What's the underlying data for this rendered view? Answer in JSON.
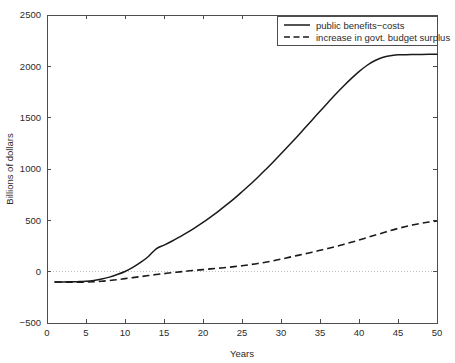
{
  "chart_data": {
    "type": "line",
    "title": "",
    "xlabel": "Years",
    "ylabel": "Billions of dollars",
    "xlim": [
      0,
      50
    ],
    "ylim": [
      -500,
      2500
    ],
    "xticks": [
      0,
      5,
      10,
      15,
      20,
      25,
      30,
      35,
      40,
      45,
      50
    ],
    "xtick_labels": [
      "0",
      "5",
      "10",
      "15",
      "20",
      "25",
      "30",
      "35",
      "40",
      "45",
      "50"
    ],
    "yticks": [
      -500,
      0,
      500,
      1000,
      1500,
      2000,
      2500
    ],
    "ytick_labels": [
      "-500",
      "0",
      "500",
      "1000",
      "1500",
      "2000",
      "2500"
    ],
    "grid": false,
    "zero_reference_line": true,
    "legend_position": "top-right",
    "x": [
      1,
      2,
      3,
      4,
      5,
      6,
      7,
      8,
      9,
      10,
      11,
      12,
      13,
      14,
      15,
      16,
      17,
      18,
      19,
      20,
      21,
      22,
      23,
      24,
      25,
      26,
      27,
      28,
      29,
      30,
      31,
      32,
      33,
      34,
      35,
      36,
      37,
      38,
      39,
      40,
      41,
      42,
      43,
      44,
      45,
      46,
      47,
      48,
      49,
      50
    ],
    "series": [
      {
        "name": "public benefits−costs",
        "style": "solid",
        "color": "#1a1a1a",
        "values": [
          -100,
          -100,
          -99,
          -97,
          -93,
          -85,
          -72,
          -53,
          -28,
          2,
          42,
          90,
          148,
          222,
          258,
          296,
          338,
          382,
          430,
          480,
          534,
          590,
          650,
          712,
          778,
          846,
          918,
          992,
          1068,
          1148,
          1228,
          1310,
          1394,
          1478,
          1562,
          1646,
          1728,
          1806,
          1880,
          1948,
          2008,
          2054,
          2086,
          2104,
          2112,
          2114,
          2115,
          2116,
          2117,
          2118
        ]
      },
      {
        "name": "increase in govt. budget surplus",
        "style": "dashed",
        "color": "#1a1a1a",
        "values": [
          -100,
          -101,
          -102,
          -102,
          -101,
          -98,
          -93,
          -86,
          -78,
          -68,
          -58,
          -48,
          -38,
          -28,
          -19,
          -10,
          -2,
          6,
          13,
          20,
          27,
          34,
          41,
          49,
          58,
          68,
          79,
          92,
          106,
          122,
          139,
          156,
          173,
          190,
          208,
          226,
          245,
          265,
          286,
          308,
          331,
          354,
          377,
          400,
          421,
          440,
          457,
          472,
          484,
          494
        ]
      }
    ]
  },
  "legend": {
    "entries": [
      {
        "label": "public benefits−costs",
        "style": "solid"
      },
      {
        "label": "increase in govt. budget surplus",
        "style": "dashed"
      }
    ]
  }
}
